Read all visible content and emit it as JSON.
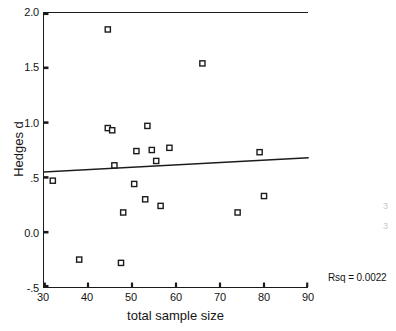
{
  "chart_data": {
    "type": "scatter",
    "title": "",
    "xlabel": "total sample size",
    "ylabel": "Hedges d",
    "xlim": [
      30,
      90
    ],
    "ylim": [
      -0.5,
      2.0
    ],
    "xticks": [
      "30",
      "40",
      "50",
      "60",
      "70",
      "80",
      "90"
    ],
    "xtick_values": [
      30,
      40,
      50,
      60,
      70,
      80,
      90
    ],
    "yticks": [
      "2.0",
      "1.5",
      "1.0",
      ".5",
      "0.0",
      "-.5"
    ],
    "ytick_values": [
      2.0,
      1.5,
      1.0,
      0.5,
      0.0,
      -0.5
    ],
    "grid": false,
    "legend": false,
    "marker": "open-square",
    "points": [
      {
        "x": 32.0,
        "y": 0.47
      },
      {
        "x": 38.0,
        "y": -0.25
      },
      {
        "x": 44.5,
        "y": 1.85
      },
      {
        "x": 44.5,
        "y": 0.95
      },
      {
        "x": 45.5,
        "y": 0.93
      },
      {
        "x": 46.0,
        "y": 0.61
      },
      {
        "x": 47.5,
        "y": -0.28
      },
      {
        "x": 48.0,
        "y": 0.18
      },
      {
        "x": 50.5,
        "y": 0.44
      },
      {
        "x": 51.0,
        "y": 0.74
      },
      {
        "x": 53.0,
        "y": 0.3
      },
      {
        "x": 53.5,
        "y": 0.97
      },
      {
        "x": 54.5,
        "y": 0.75
      },
      {
        "x": 55.5,
        "y": 0.65
      },
      {
        "x": 56.5,
        "y": 0.24
      },
      {
        "x": 58.5,
        "y": 0.77
      },
      {
        "x": 66.0,
        "y": 1.54
      },
      {
        "x": 74.0,
        "y": 0.18
      },
      {
        "x": 79.0,
        "y": 0.73
      },
      {
        "x": 80.0,
        "y": 0.33
      }
    ],
    "fit_line": {
      "type": "linear-regression",
      "x_start": 30,
      "y_start": 0.55,
      "x_end": 90,
      "y_end": 0.68
    },
    "annotations": [
      {
        "name": "rsq",
        "text": "Rsq = 0.0022",
        "value": 0.0022
      }
    ]
  },
  "artifacts": {
    "noise_marks": [
      "3",
      "3"
    ]
  }
}
